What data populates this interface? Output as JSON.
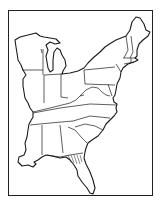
{
  "map": {
    "title": "Eastern United States outline map",
    "region": "Eastern United States",
    "style": "black line drawing on white",
    "colors": {
      "line": "#1a1a1a",
      "background": "#ffffff"
    },
    "states": [
      "Wisconsin",
      "Michigan",
      "Illinois",
      "Indiana",
      "Ohio",
      "Kentucky",
      "Tennessee",
      "Mississippi",
      "Alabama",
      "Georgia",
      "Florida",
      "South Carolina",
      "North Carolina",
      "Virginia",
      "West Virginia",
      "Maryland",
      "Delaware",
      "New Jersey",
      "Pennsylvania",
      "New York",
      "Connecticut",
      "Rhode Island",
      "Massachusetts",
      "Vermont",
      "New Hampshire",
      "Maine",
      "Louisiana (partial)"
    ],
    "highlighted_area": "hatched region in north Florida / south Georgia"
  }
}
